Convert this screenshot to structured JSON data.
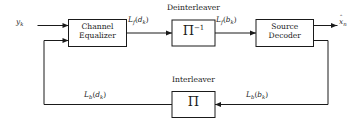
{
  "diagram": {
    "background_color": "#ffffff",
    "line_color": "#1a1a1a",
    "blocks": [
      {
        "id": "channel-equalizer",
        "label_line1": "Channel",
        "label_line2": "Equalizer"
      },
      {
        "id": "deinterleaver",
        "section_title": "Deinterleaver",
        "glyph": "Π",
        "exponent": "−1"
      },
      {
        "id": "source-decoder",
        "label_line1": "Source",
        "label_line2": "Decoder"
      },
      {
        "id": "interleaver",
        "section_title": "Interleaver",
        "glyph": "Π"
      }
    ],
    "signals": {
      "input": {
        "base": "y",
        "sub": "k"
      },
      "forward_dk": {
        "base": "L",
        "base_sub": "f",
        "arg": "d",
        "arg_sub": "k"
      },
      "forward_bk": {
        "base": "L",
        "base_sub": "f",
        "arg": "b",
        "arg_sub": "k"
      },
      "output": {
        "base": "x",
        "accent": "ˆ",
        "sub": "n"
      },
      "backward_bk": {
        "base": "L",
        "base_sub": "b",
        "arg": "b",
        "arg_sub": "k"
      },
      "backward_dk": {
        "base": "L",
        "base_sub": "b",
        "arg": "d",
        "arg_sub": "k"
      }
    }
  }
}
